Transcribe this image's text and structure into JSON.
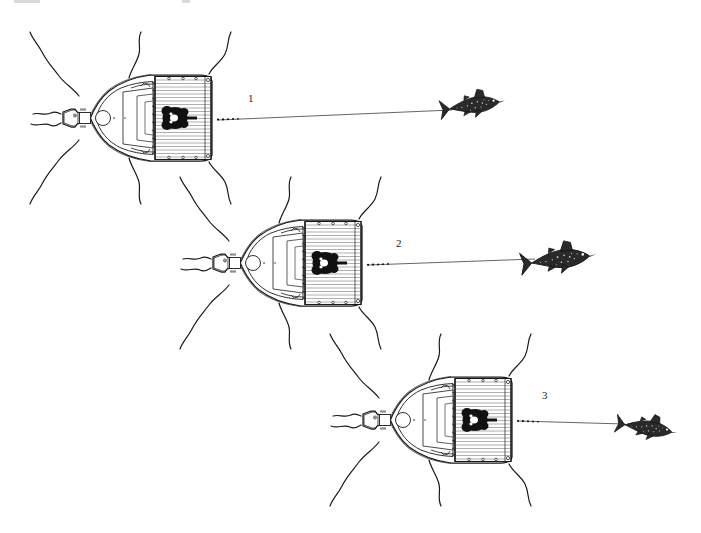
{
  "figure": {
    "type": "technical-line-illustration",
    "background_color": "#ffffff",
    "ink_color": "#1a1a1a",
    "canvas": {
      "width": 701,
      "height": 533
    }
  },
  "scenes": [
    {
      "id": "scene-1",
      "label": "1",
      "label_x": 248,
      "label_y": 102,
      "boat": {
        "name": "sport-fishing-boat",
        "orientation": "overhead-bow-left",
        "center_x": 143,
        "center_y": 118,
        "scale": 1.0,
        "parts": [
          "bow-pulpit",
          "instrument-panel",
          "foredeck-hatch",
          "cockpit",
          "transom-deck",
          "fighting-chair",
          "angler"
        ]
      },
      "fish": {
        "name": "hooked-game-fish",
        "species_hint": "tuna",
        "center_x": 474,
        "center_y": 105,
        "scale": 0.95,
        "heading": "up-right"
      },
      "line": {
        "name": "fishing-line",
        "from_x": 218,
        "from_y": 120,
        "to_x": 452,
        "to_y": 110
      },
      "wake": {
        "name": "wake-lines",
        "count": 6
      }
    },
    {
      "id": "scene-2",
      "label": "2",
      "label_x": 396,
      "label_y": 247,
      "boat": {
        "name": "sport-fishing-boat",
        "orientation": "overhead-bow-left",
        "center_x": 293,
        "center_y": 263,
        "scale": 1.0,
        "parts": [
          "bow-pulpit",
          "instrument-panel",
          "foredeck-hatch",
          "cockpit",
          "transom-deck",
          "fighting-chair",
          "angler"
        ]
      },
      "fish": {
        "name": "hooked-game-fish",
        "species_hint": "shark",
        "center_x": 560,
        "center_y": 259,
        "scale": 1.1,
        "heading": "up-right"
      },
      "line": {
        "name": "fishing-line",
        "from_x": 368,
        "from_y": 265,
        "to_x": 535,
        "to_y": 262
      },
      "wake": {
        "name": "wake-lines",
        "count": 6
      }
    },
    {
      "id": "scene-3",
      "label": "3",
      "label_x": 542,
      "label_y": 399,
      "boat": {
        "name": "sport-fishing-boat",
        "orientation": "overhead-bow-left",
        "center_x": 443,
        "center_y": 420,
        "scale": 1.0,
        "parts": [
          "bow-pulpit",
          "instrument-panel",
          "foredeck-hatch",
          "cockpit",
          "transom-deck",
          "fighting-chair",
          "angler"
        ]
      },
      "fish": {
        "name": "hooked-game-fish",
        "species_hint": "marlin",
        "center_x": 648,
        "center_y": 428,
        "scale": 0.9,
        "heading": "down-right"
      },
      "line": {
        "name": "fishing-line",
        "from_x": 518,
        "from_y": 421,
        "to_x": 622,
        "to_y": 424
      },
      "wake": {
        "name": "wake-lines",
        "count": 6
      }
    }
  ],
  "boat_detail_labels": {
    "panel_top": "",
    "panel_bottom": ""
  }
}
